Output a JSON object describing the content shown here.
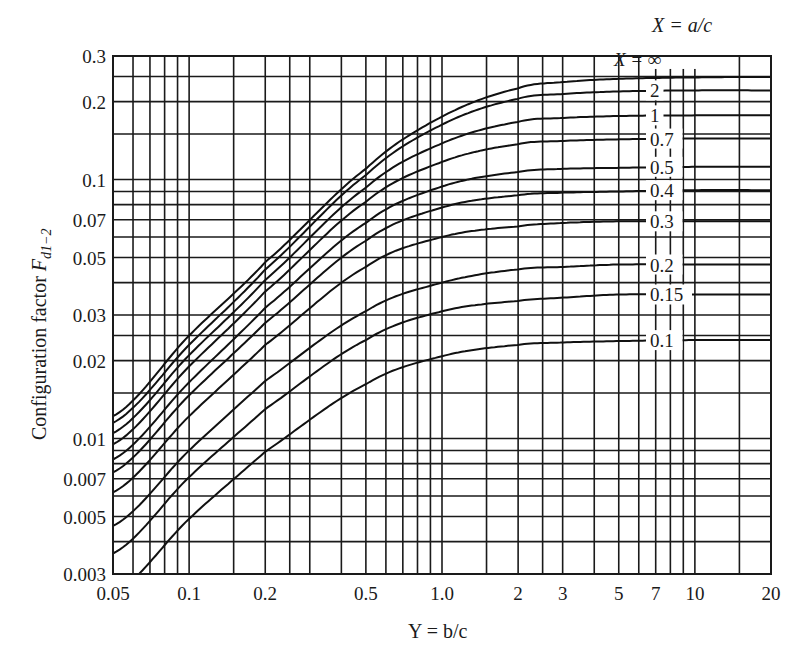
{
  "chart_data": {
    "type": "line",
    "title": "",
    "xlabel": "Y = b/c",
    "ylabel": "Configuration factor F_d1-2",
    "x_scale": "log",
    "y_scale": "log",
    "xlim": [
      0.05,
      20
    ],
    "ylim": [
      0.003,
      0.3
    ],
    "grid": true,
    "legend_title": "X = a/c",
    "x_ticks": [
      "0.05",
      "0.1",
      "0.2",
      "0.5",
      "1.0",
      "2",
      "3",
      "5",
      "7",
      "10",
      "20"
    ],
    "x_tick_values": [
      0.05,
      0.1,
      0.2,
      0.5,
      1.0,
      2,
      3,
      5,
      7,
      10,
      20
    ],
    "y_ticks": [
      "0.3",
      "0.2",
      "0.1",
      "0.07",
      "0.05",
      "0.03",
      "0.02",
      "0.01",
      "0.007",
      "0.005",
      "0.003"
    ],
    "y_tick_values": [
      0.3,
      0.2,
      0.1,
      0.07,
      0.05,
      0.03,
      0.02,
      0.01,
      0.007,
      0.005,
      0.003
    ],
    "x_gridlines": [
      0.05,
      0.06,
      0.07,
      0.08,
      0.09,
      0.1,
      0.15,
      0.2,
      0.25,
      0.3,
      0.4,
      0.5,
      0.6,
      0.7,
      0.8,
      0.9,
      1.0,
      1.5,
      2,
      2.5,
      3,
      4,
      5,
      6,
      7,
      8,
      9,
      10,
      15,
      20
    ],
    "y_gridlines": [
      0.003,
      0.004,
      0.005,
      0.006,
      0.007,
      0.008,
      0.009,
      0.01,
      0.015,
      0.02,
      0.025,
      0.03,
      0.04,
      0.05,
      0.06,
      0.07,
      0.08,
      0.09,
      0.1,
      0.15,
      0.2,
      0.25,
      0.3
    ],
    "x": [
      0.05,
      0.1,
      0.2,
      0.5,
      1.0,
      2,
      3,
      5,
      10,
      20
    ],
    "series": [
      {
        "name": "X = ∞",
        "label": "X = ∞",
        "values": [
          0.0122,
          0.025,
          0.048,
          0.11,
          0.175,
          0.225,
          0.238,
          0.245,
          0.248,
          0.249
        ]
      },
      {
        "name": "2",
        "label": "2",
        "values": [
          0.0115,
          0.023,
          0.045,
          0.104,
          0.163,
          0.205,
          0.214,
          0.219,
          0.221,
          0.221
        ]
      },
      {
        "name": "1",
        "label": "1",
        "values": [
          0.0105,
          0.021,
          0.041,
          0.093,
          0.138,
          0.167,
          0.173,
          0.176,
          0.177,
          0.177
        ]
      },
      {
        "name": "0.7",
        "label": "0.7",
        "values": [
          0.0095,
          0.019,
          0.037,
          0.082,
          0.117,
          0.137,
          0.141,
          0.143,
          0.144,
          0.144
        ]
      },
      {
        "name": "0.5",
        "label": "0.5",
        "values": [
          0.0083,
          0.0165,
          0.032,
          0.068,
          0.094,
          0.107,
          0.11,
          0.111,
          0.112,
          0.112
        ]
      },
      {
        "name": "0.4",
        "label": "0.4",
        "values": [
          0.0074,
          0.0147,
          0.028,
          0.058,
          0.078,
          0.087,
          0.089,
          0.09,
          0.091,
          0.091
        ]
      },
      {
        "name": "0.3",
        "label": "0.3",
        "values": [
          0.0062,
          0.0122,
          0.023,
          0.046,
          0.06,
          0.066,
          0.068,
          0.069,
          0.069,
          0.069
        ]
      },
      {
        "name": "0.2",
        "label": "0.2",
        "values": [
          0.0046,
          0.009,
          0.0167,
          0.031,
          0.04,
          0.045,
          0.046,
          0.047,
          0.047,
          0.047
        ]
      },
      {
        "name": "0.15",
        "label": "0.15",
        "values": [
          0.0036,
          0.0071,
          0.013,
          0.024,
          0.031,
          0.034,
          0.035,
          0.036,
          0.036,
          0.036
        ]
      },
      {
        "name": "0.1",
        "label": "0.1",
        "values": [
          0.0025,
          0.0049,
          0.0089,
          0.0162,
          0.0208,
          0.023,
          0.0235,
          0.0238,
          0.024,
          0.024
        ]
      }
    ]
  },
  "labels": {
    "legend_title": "X = a/c",
    "xlabel": "Y = b/c",
    "ylabel_main": "Configuration factor ",
    "ylabel_symbol": "F",
    "ylabel_sub": "d1−2"
  }
}
